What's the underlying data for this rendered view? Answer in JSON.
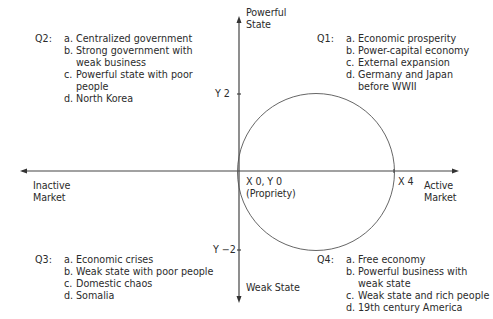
{
  "axes": {
    "y_top_label": "Powerful State",
    "y_top_label_lines": [
      "Powerful",
      "State"
    ],
    "y_bottom_label": "Weak State",
    "x_left_label_lines": [
      "Inactive",
      "Market"
    ],
    "x_right_label_lines": [
      "Active",
      "Market"
    ],
    "tick_y_pos": "Y 2",
    "tick_y_neg": "Y −2",
    "tick_x_pos": "X 4",
    "origin_label_lines": [
      "X 0, Y 0",
      "(Propriety)"
    ],
    "line_color": "#444444"
  },
  "quadrants": {
    "q1": {
      "id": "Q1:",
      "items": [
        {
          "marker": "a.",
          "text": "Economic prosperity"
        },
        {
          "marker": "b.",
          "text": "Power-capital economy"
        },
        {
          "marker": "c.",
          "text": "External expansion"
        },
        {
          "marker": "d.",
          "text": "Germany and Japan before WWII"
        }
      ]
    },
    "q2": {
      "id": "Q2:",
      "items": [
        {
          "marker": "a.",
          "text": "Centralized government"
        },
        {
          "marker": "b.",
          "text": "Strong government with weak business"
        },
        {
          "marker": "c.",
          "text": "Powerful state with poor people"
        },
        {
          "marker": "d.",
          "text": "North Korea"
        }
      ]
    },
    "q3": {
      "id": "Q3:",
      "items": [
        {
          "marker": "a.",
          "text": "Economic crises"
        },
        {
          "marker": "b.",
          "text": "Weak state with poor people"
        },
        {
          "marker": "c.",
          "text": "Domestic chaos"
        },
        {
          "marker": "d.",
          "text": "Somalia"
        }
      ]
    },
    "q4": {
      "id": "Q4:",
      "items": [
        {
          "marker": "a.",
          "text": "Free economy"
        },
        {
          "marker": "b.",
          "text": "Powerful business with weak state"
        },
        {
          "marker": "c.",
          "text": "Weak state and rich people"
        },
        {
          "marker": "d.",
          "text": "19th century America"
        }
      ]
    }
  },
  "circle": {
    "center": "X 2, Y 0",
    "radius_units": 2
  }
}
